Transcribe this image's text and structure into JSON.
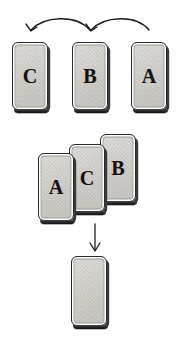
{
  "diagram": {
    "background_color": "#ffffff",
    "ink_color": "#1d1d1d",
    "card_fill_color": "#d5d3ce",
    "card_border_color": "#2a2a2a",
    "card_shadow_color": "#232323"
  },
  "rows": {
    "top_row": {
      "name": "source-card-row",
      "cards": [
        {
          "label": "C",
          "x": 12,
          "y": 42,
          "w": 36,
          "h": 68
        },
        {
          "label": "B",
          "x": 72,
          "y": 42,
          "w": 36,
          "h": 68
        },
        {
          "label": "A",
          "x": 131,
          "y": 42,
          "w": 36,
          "h": 68
        }
      ]
    },
    "stack_row": {
      "name": "fanned-card-stack",
      "cards": [
        {
          "label": "A",
          "x": 38,
          "y": 153,
          "w": 36,
          "h": 68
        },
        {
          "label": "C",
          "x": 69,
          "y": 144,
          "w": 36,
          "h": 68
        },
        {
          "label": "B",
          "x": 100,
          "y": 134,
          "w": 36,
          "h": 68
        }
      ]
    },
    "result_row": {
      "name": "result-card",
      "cards": [
        {
          "label": "",
          "x": 71,
          "y": 256,
          "w": 36,
          "h": 70
        }
      ]
    }
  },
  "arrows": {
    "curved": [
      {
        "name": "arrow-b-to-c",
        "path": "M 90 30 C 76 14, 44 16, 31 30",
        "head": "M 26 24 L 31 31 L 37 27",
        "stroke_width": 1.3
      },
      {
        "name": "arrow-a-to-b",
        "path": "M 149 30 C 136 14, 104 16, 91 30",
        "head": "M 86 24 L 91 31 L 97 27",
        "stroke_width": 1.3
      }
    ],
    "straight": [
      {
        "name": "arrow-stack-to-result",
        "path": "M 95 224 L 95 250",
        "head": "M 90 243 L 95 251 L 100 243",
        "stroke_width": 1.3
      }
    ]
  }
}
